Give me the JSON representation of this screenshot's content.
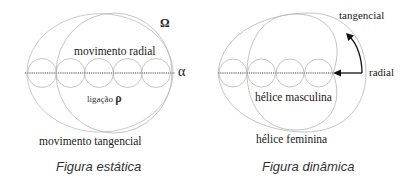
{
  "static_figure": {
    "caption": "Figura estática",
    "labels": {
      "omega": "Ω",
      "alpha": "α",
      "radial": "movimento radial",
      "binding": "ligação",
      "rho": "ρ",
      "tangential": "movimento tangencial"
    }
  },
  "dynamic_figure": {
    "caption": "Figura dinâmica",
    "labels": {
      "tangential": "tangencial",
      "radial": "radial",
      "male_helix": "hélice masculina",
      "female_helix": "hélice feminina"
    }
  },
  "colors": {
    "line": "#b5b5b5",
    "axis": "#9a9a9a",
    "arrow": "#111111",
    "text": "#222222"
  }
}
